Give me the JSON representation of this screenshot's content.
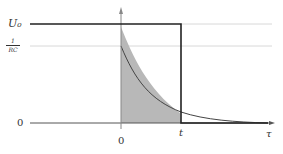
{
  "diagram": {
    "title": "",
    "y_labels": {
      "u0": "U₀",
      "inv_rc_num": "1",
      "inv_rc_den": "RC",
      "zero": "0"
    },
    "x_labels": {
      "zero": "0",
      "t": "t",
      "tau": "τ"
    },
    "colors": {
      "line": "#222222",
      "fill": "#b8b8b8",
      "guide": "#d8d8d8",
      "curve": "#444444"
    },
    "elements": [
      "step function U₀ from left to τ=t then dropping to 0",
      "exponential kernel (1/RC)·e^(-τ/RC) starting at τ=0",
      "shaded area under product curve between 0 and t",
      "horizontal guide lines at U₀ and 1/RC"
    ]
  }
}
